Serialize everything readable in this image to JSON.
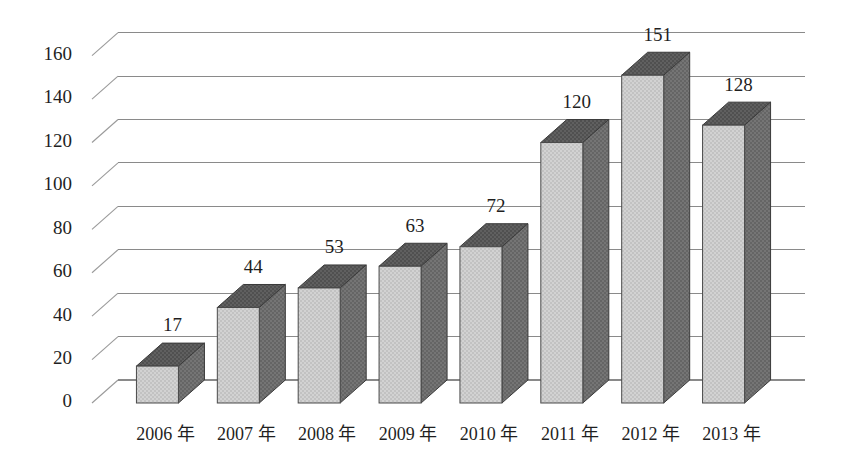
{
  "chart_data": {
    "type": "bar",
    "title": "",
    "subtitle": "",
    "xlabel": "",
    "ylabel": "",
    "categories": [
      "2006 年",
      "2007 年",
      "2008 年",
      "2009 年",
      "2010 年",
      "2011 年",
      "2012 年",
      "2013 年"
    ],
    "values": [
      17,
      44,
      53,
      63,
      72,
      120,
      151,
      128
    ],
    "data_labels": [
      "17",
      "44",
      "53",
      "63",
      "72",
      "120",
      "151",
      "128"
    ],
    "ylim": [
      0,
      170
    ],
    "yticks": [
      0,
      20,
      40,
      60,
      80,
      100,
      120,
      140,
      160
    ],
    "ytick_labels": [
      "0",
      "20",
      "40",
      "60",
      "80",
      "100",
      "120",
      "140",
      "160"
    ],
    "grid": true,
    "grid_axis": "y",
    "legend": false,
    "legend_position": "none",
    "style": "3d-column",
    "colors": {
      "bar_front": "#cccccc",
      "bar_side": "#6e6e6e",
      "bar_top": "#5a5a5a",
      "bar_outline": "#3f3f3f",
      "gridline": "#8a8a8a",
      "depthline": "#9a9a9a",
      "text": "#1f1f1f",
      "background": "#ffffff"
    }
  },
  "axis": {
    "y_tick_labels": [
      "160",
      "140",
      "120",
      "100",
      "80",
      "60",
      "40",
      "20",
      "0"
    ],
    "x_tick_labels": [
      "2006 年",
      "2007 年",
      "2008 年",
      "2009 年",
      "2010 年",
      "2011 年",
      "2012 年",
      "2013 年"
    ]
  },
  "bars": [
    {
      "name": "bar-2006",
      "label": "2006 年",
      "value": "17"
    },
    {
      "name": "bar-2007",
      "label": "2007 年",
      "value": "44"
    },
    {
      "name": "bar-2008",
      "label": "2008 年",
      "value": "53"
    },
    {
      "name": "bar-2009",
      "label": "2009 年",
      "value": "63"
    },
    {
      "name": "bar-2010",
      "label": "2010 年",
      "value": "72"
    },
    {
      "name": "bar-2011",
      "label": "2011 年",
      "value": "120"
    },
    {
      "name": "bar-2012",
      "label": "2012 年",
      "value": "151"
    },
    {
      "name": "bar-2013",
      "label": "2013 年",
      "value": "128"
    }
  ]
}
